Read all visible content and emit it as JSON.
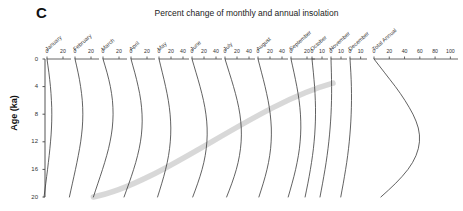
{
  "panel": {
    "label": "C"
  },
  "title": "Percent change of monthly and annual insolation",
  "yaxis": {
    "label": "Age (ka)",
    "ticks": [
      0,
      4,
      8,
      12,
      16,
      20
    ],
    "min": 0,
    "max": 20
  },
  "chart_data": {
    "type": "line",
    "title": "Percent change of monthly and annual insolation",
    "xlabel": "Percent change",
    "ylabel": "Age (ka)",
    "ylim": [
      0,
      20
    ],
    "y_inverted": true,
    "grid": false,
    "legend": "none",
    "y": [
      0,
      1,
      2,
      3,
      4,
      5,
      6,
      7,
      8,
      9,
      10,
      11,
      12,
      13,
      14,
      15,
      16,
      17,
      18,
      19,
      20
    ],
    "panels": [
      {
        "name": "January",
        "xlim": [
          0,
          30
        ],
        "xticks": [
          0,
          20
        ],
        "values": [
          0,
          1.2,
          2.4,
          3.4,
          4.3,
          5.0,
          5.5,
          5.9,
          6.0,
          5.9,
          5.6,
          5.1,
          4.4,
          3.6,
          2.7,
          1.7,
          0.7,
          -0.4,
          -1.5,
          -2.6,
          -3.7
        ]
      },
      {
        "name": "February",
        "xlim": [
          0,
          30
        ],
        "xticks": [
          0,
          20
        ],
        "values": [
          0,
          2.0,
          3.9,
          5.6,
          7.0,
          8.2,
          9.1,
          9.6,
          9.8,
          9.6,
          9.1,
          8.2,
          7.1,
          5.7,
          4.1,
          2.4,
          0.6,
          -1.3,
          -3.2,
          -5.1,
          -7.0
        ]
      },
      {
        "name": "March",
        "xlim": [
          0,
          30
        ],
        "xticks": [
          0,
          20
        ],
        "values": [
          0,
          2.6,
          5.1,
          7.3,
          9.2,
          10.7,
          11.8,
          12.4,
          12.6,
          12.3,
          11.6,
          10.4,
          8.8,
          6.9,
          4.6,
          2.1,
          -0.6,
          -3.4,
          -6.3,
          -9.2,
          -12.0
        ]
      },
      {
        "name": "April",
        "xlim": [
          0,
          30
        ],
        "xticks": [
          0,
          20
        ],
        "values": [
          0,
          2.4,
          4.8,
          7.0,
          9.0,
          10.8,
          12.2,
          13.2,
          13.8,
          14.0,
          13.7,
          13.0,
          11.8,
          10.2,
          8.2,
          5.9,
          3.3,
          0.5,
          -2.5,
          -5.6,
          -8.7
        ]
      },
      {
        "name": "May",
        "xlim": [
          0,
          50
        ],
        "xticks": [
          0,
          20,
          40
        ],
        "values": [
          0,
          2.8,
          5.6,
          8.4,
          11.0,
          13.4,
          15.5,
          17.2,
          18.5,
          19.3,
          19.7,
          19.5,
          18.8,
          17.6,
          15.9,
          13.7,
          11.0,
          8.0,
          4.7,
          1.2,
          -2.4
        ]
      },
      {
        "name": "June",
        "xlim": [
          0,
          50
        ],
        "xticks": [
          0,
          20,
          40
        ],
        "values": [
          0,
          3.4,
          6.8,
          10.2,
          13.4,
          16.4,
          19.1,
          21.4,
          23.2,
          24.5,
          25.2,
          25.3,
          24.8,
          23.7,
          22.0,
          19.7,
          16.8,
          13.4,
          9.6,
          5.5,
          1.2
        ]
      },
      {
        "name": "July",
        "xlim": [
          0,
          50
        ],
        "xticks": [
          0,
          20,
          40
        ],
        "values": [
          0,
          3.6,
          7.2,
          10.8,
          14.2,
          17.4,
          20.3,
          22.8,
          24.8,
          26.2,
          27.1,
          27.3,
          26.9,
          25.8,
          24.1,
          21.8,
          18.9,
          15.4,
          11.5,
          7.2,
          2.7
        ]
      },
      {
        "name": "August",
        "xlim": [
          0,
          50
        ],
        "xticks": [
          0,
          20,
          40
        ],
        "values": [
          0,
          3.0,
          6.0,
          9.0,
          11.8,
          14.4,
          16.8,
          18.8,
          20.4,
          21.5,
          22.2,
          22.3,
          21.9,
          21.0,
          19.5,
          17.5,
          15.0,
          12.1,
          8.8,
          5.2,
          1.5
        ]
      },
      {
        "name": "September",
        "xlim": [
          0,
          30
        ],
        "xticks": [
          0,
          20
        ],
        "values": [
          0,
          1.9,
          3.8,
          5.6,
          7.3,
          8.8,
          10.1,
          11.1,
          11.8,
          12.2,
          12.3,
          12.0,
          11.4,
          10.5,
          9.2,
          7.6,
          5.8,
          3.7,
          1.4,
          -1.0,
          -3.5
        ]
      },
      {
        "name": "October",
        "xlim": [
          0,
          16
        ],
        "xticks": [
          0,
          10
        ],
        "values": [
          0,
          0.7,
          1.4,
          2.0,
          2.6,
          3.0,
          3.3,
          3.5,
          3.5,
          3.4,
          3.1,
          2.7,
          2.1,
          1.4,
          0.5,
          -0.5,
          -1.6,
          -2.8,
          -4.1,
          -5.5,
          -6.9
        ]
      },
      {
        "name": "November",
        "xlim": [
          0,
          16
        ],
        "xticks": [
          0,
          10
        ],
        "values": [
          0,
          0.2,
          0.4,
          0.5,
          0.6,
          0.6,
          0.5,
          0.3,
          0.0,
          -0.4,
          -0.9,
          -1.5,
          -2.2,
          -3.0,
          -3.9,
          -4.9,
          -6.0,
          -7.2,
          -8.4,
          -9.7,
          -11.0
        ]
      },
      {
        "name": "December",
        "xlim": [
          0,
          16
        ],
        "xticks": [
          0,
          10
        ],
        "values": [
          0,
          0.4,
          0.8,
          1.1,
          1.3,
          1.4,
          1.4,
          1.3,
          1.1,
          0.8,
          0.4,
          -0.1,
          -0.7,
          -1.4,
          -2.2,
          -3.1,
          -4.1,
          -5.2,
          -6.3,
          -7.5,
          -8.7
        ]
      },
      {
        "name": "Total Annual",
        "xlim": [
          0,
          110
        ],
        "xticks": [
          0,
          20,
          40,
          60,
          80,
          100
        ],
        "values": [
          0,
          7.0,
          14.0,
          21.0,
          28.0,
          34.5,
          40.5,
          46.0,
          51.0,
          55.0,
          58.0,
          59.5,
          59.5,
          58.0,
          55.0,
          50.5,
          44.5,
          37.0,
          28.5,
          19.0,
          9.0
        ]
      }
    ],
    "annotations": [
      {
        "name": "gray-diagonal-band",
        "description": "thick light-gray band from lower-left to upper-right",
        "from": {
          "panel_index": 2,
          "age": 20
        },
        "to": {
          "panel_index": 10,
          "age": 3.5
        }
      }
    ]
  }
}
